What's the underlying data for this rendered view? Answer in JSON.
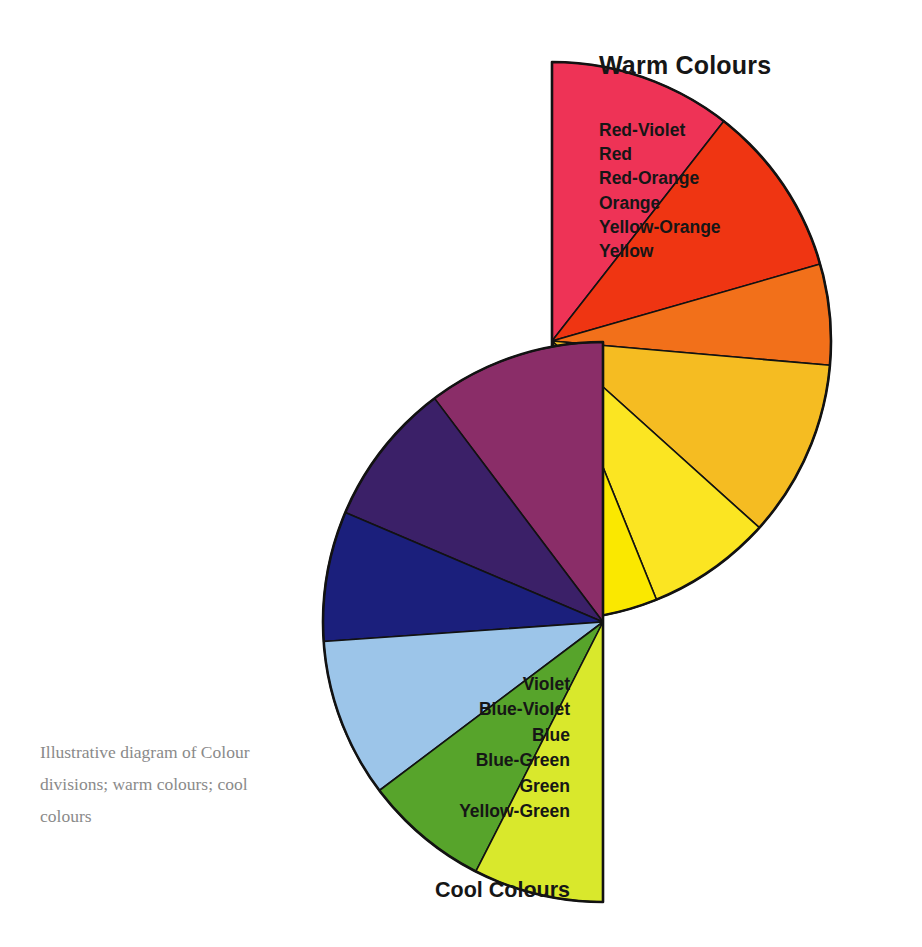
{
  "figure": {
    "background": "#ffffff",
    "caption": "Illustrative diagram of Colour divisions; warm colours; cool colours",
    "caption_color": "#8a8a8a",
    "outline_color": "#121212"
  },
  "warm": {
    "heading": "Warm Colours",
    "labels": [
      "Red-Violet",
      "Red",
      "Red-Orange",
      "Orange",
      "Yellow-Orange",
      "Yellow"
    ]
  },
  "cool": {
    "heading": "Cool Colours",
    "labels": [
      "Violet",
      "Blue-Violet",
      "Blue",
      "Blue-Green",
      "Green",
      "Yellow-Green"
    ]
  },
  "chart_data": {
    "type": "pie",
    "xlabel": "",
    "ylabel": "",
    "legend_position": "right-and-left",
    "grid": false,
    "charts": [
      {
        "name": "Warm Colours half-wheel",
        "center": [
          552,
          341
        ],
        "radius": 279,
        "half": "right",
        "start_angle_deg": -90,
        "end_angle_deg": 90,
        "direction": "clockwise",
        "slices": [
          {
            "label": "Red-Violet",
            "color": "#ee3356",
            "sweep_deg": 38
          },
          {
            "label": "Red",
            "color": "#ef3512",
            "sweep_deg": 36
          },
          {
            "label": "Red-Orange",
            "color": "#f2701a",
            "sweep_deg": 21
          },
          {
            "label": "Orange",
            "color": "#f5bc22",
            "sweep_deg": 37
          },
          {
            "label": "Yellow-Orange",
            "color": "#fbe522",
            "sweep_deg": 26
          },
          {
            "label": "Yellow",
            "color": "#fae800",
            "sweep_deg": 22
          }
        ]
      },
      {
        "name": "Cool Colours half-wheel",
        "center": [
          603,
          622
        ],
        "radius": 280,
        "half": "left",
        "start_angle_deg": -90,
        "end_angle_deg": 90,
        "direction": "counter-clockwise",
        "slices": [
          {
            "label": "Violet",
            "color": "#8a2d68",
            "sweep_deg": 37
          },
          {
            "label": "Blue-Violet",
            "color": "#3b2068",
            "sweep_deg": 30
          },
          {
            "label": "Blue",
            "color": "#1b1f7c",
            "sweep_deg": 27
          },
          {
            "label": "Blue-Green",
            "color": "#9cc5e9",
            "sweep_deg": 33
          },
          {
            "label": "Green",
            "color": "#57a42b",
            "sweep_deg": 26
          },
          {
            "label": "Yellow-Green",
            "color": "#d9e82c",
            "sweep_deg": 27
          }
        ]
      }
    ]
  }
}
